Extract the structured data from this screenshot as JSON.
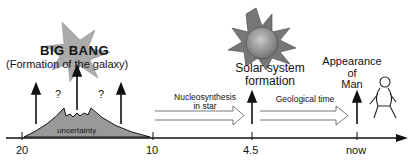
{
  "events": {
    "big_bang": {
      "title": "BIG BANG",
      "subtitle": "(Formation of the galaxy)"
    },
    "solar_system": {
      "label_line1": "Solar system",
      "label_line2": "formation"
    },
    "man": {
      "label_line1": "Appearance",
      "label_line2": "of",
      "label_line3": "Man"
    }
  },
  "uncertainty": {
    "label": "uncertainty",
    "question_mark_left": "?",
    "question_mark_right": "?"
  },
  "process_arrows": {
    "nucleosynthesis": {
      "line1": "Nucleosynthesis",
      "line2": "in star"
    },
    "geological": {
      "line1": "Geological time"
    }
  },
  "axis": {
    "ticks": [
      {
        "label": "20",
        "x": 28
      },
      {
        "label": "10",
        "x": 153
      },
      {
        "label": "4.5",
        "x": 252
      },
      {
        "label": "now",
        "x": 357
      }
    ],
    "unit_note": ""
  },
  "colors": {
    "ink": "#111111",
    "gray_fill": "#999999",
    "light_gray": "#c8c8c8"
  }
}
